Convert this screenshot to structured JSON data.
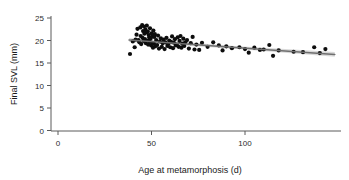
{
  "chart_data": {
    "type": "scatter",
    "title": "",
    "xlabel": "Age at metamorphosis (d)",
    "ylabel": "Final SVL (mm)",
    "xlim": [
      0,
      155
    ],
    "ylim": [
      0,
      25
    ],
    "xticks": [
      0,
      50,
      100
    ],
    "yticks": [
      0,
      5,
      10,
      15,
      20,
      25
    ],
    "xtick_labels": [
      "0",
      "50",
      "100"
    ],
    "ytick_labels": [
      "0",
      "5",
      "10",
      "15",
      "20",
      "25"
    ],
    "grid": false,
    "legend": false,
    "marker_color": "#0d0d0d",
    "line_color": "#6f6f6f",
    "band_color": "#b9b9b9",
    "axis_color": "#5a5a5a",
    "points": [
      [
        38.5,
        17.0
      ],
      [
        40.0,
        19.8
      ],
      [
        41.0,
        18.5
      ],
      [
        41.5,
        20.2
      ],
      [
        42.0,
        21.3
      ],
      [
        42.5,
        22.6
      ],
      [
        43.0,
        20.1
      ],
      [
        43.5,
        19.6
      ],
      [
        44.0,
        22.9
      ],
      [
        44.2,
        21.0
      ],
      [
        44.5,
        19.2
      ],
      [
        45.0,
        23.4
      ],
      [
        45.2,
        20.6
      ],
      [
        45.5,
        22.1
      ],
      [
        45.8,
        19.9
      ],
      [
        46.0,
        23.1
      ],
      [
        46.2,
        21.5
      ],
      [
        46.5,
        20.3
      ],
      [
        46.8,
        22.4
      ],
      [
        47.0,
        19.4
      ],
      [
        47.2,
        21.8
      ],
      [
        47.5,
        23.3
      ],
      [
        47.8,
        20.0
      ],
      [
        48.0,
        22.0
      ],
      [
        48.2,
        19.1
      ],
      [
        48.5,
        21.2
      ],
      [
        48.8,
        20.7
      ],
      [
        49.0,
        19.7
      ],
      [
        49.2,
        22.7
      ],
      [
        49.5,
        20.4
      ],
      [
        49.8,
        18.9
      ],
      [
        50.0,
        21.6
      ],
      [
        50.3,
        19.5
      ],
      [
        50.5,
        20.9
      ],
      [
        50.8,
        18.4
      ],
      [
        51.0,
        22.2
      ],
      [
        51.3,
        19.3
      ],
      [
        51.5,
        20.8
      ],
      [
        51.8,
        21.4
      ],
      [
        52.0,
        18.7
      ],
      [
        52.5,
        20.1
      ],
      [
        53.0,
        19.0
      ],
      [
        53.5,
        21.1
      ],
      [
        54.0,
        18.2
      ],
      [
        54.5,
        19.8
      ],
      [
        55.0,
        20.5
      ],
      [
        55.5,
        18.6
      ],
      [
        56.0,
        19.4
      ],
      [
        56.5,
        20.2
      ],
      [
        57.0,
        18.1
      ],
      [
        57.5,
        19.6
      ],
      [
        58.0,
        20.6
      ],
      [
        58.5,
        18.8
      ],
      [
        59.0,
        19.2
      ],
      [
        59.5,
        20.0
      ],
      [
        60.0,
        18.5
      ],
      [
        60.5,
        19.7
      ],
      [
        61.0,
        20.9
      ],
      [
        61.5,
        18.3
      ],
      [
        62.0,
        19.5
      ],
      [
        62.5,
        20.3
      ],
      [
        63.0,
        18.9
      ],
      [
        63.5,
        19.1
      ],
      [
        64.0,
        20.7
      ],
      [
        64.5,
        18.6
      ],
      [
        65.0,
        19.9
      ],
      [
        65.5,
        21.0
      ],
      [
        66.0,
        18.4
      ],
      [
        66.5,
        19.3
      ],
      [
        67.0,
        20.4
      ],
      [
        67.5,
        18.8
      ],
      [
        68.0,
        19.6
      ],
      [
        69.0,
        20.1
      ],
      [
        70.0,
        18.2
      ],
      [
        71.0,
        19.4
      ],
      [
        72.0,
        20.8
      ],
      [
        73.0,
        18.0
      ],
      [
        74.0,
        19.1
      ],
      [
        75.5,
        17.9
      ],
      [
        77.0,
        19.5
      ],
      [
        80.0,
        18.6
      ],
      [
        83.0,
        19.6
      ],
      [
        86.0,
        18.9
      ],
      [
        88.0,
        17.8
      ],
      [
        90.0,
        18.7
      ],
      [
        93.0,
        18.3
      ],
      [
        97.0,
        18.5
      ],
      [
        100.0,
        18.1
      ],
      [
        102.0,
        17.3
      ],
      [
        105.0,
        18.4
      ],
      [
        108.0,
        17.9
      ],
      [
        110.0,
        18.0
      ],
      [
        113.0,
        19.0
      ],
      [
        115.0,
        16.6
      ],
      [
        118.0,
        17.8
      ],
      [
        126.0,
        17.5
      ],
      [
        131.0,
        17.4
      ],
      [
        137.0,
        18.5
      ],
      [
        140.0,
        17.2
      ],
      [
        143.0,
        18.1
      ]
    ],
    "regression": {
      "x_start": 38.0,
      "x_end": 148.0,
      "y_start": 20.1,
      "y_end": 16.9,
      "ci_half_start": 0.45,
      "ci_half_mid": 0.16,
      "ci_half_end": 0.52
    }
  }
}
